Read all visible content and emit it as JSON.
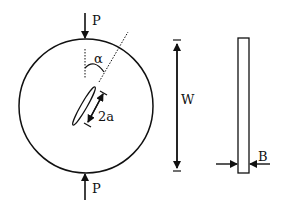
{
  "diagram": {
    "labels": {
      "load_top": "P",
      "load_bottom": "P",
      "angle": "α",
      "crack_length": "2a",
      "diameter": "W",
      "thickness": "B"
    },
    "colors": {
      "stroke": "#111111",
      "background": "#ffffff"
    }
  }
}
